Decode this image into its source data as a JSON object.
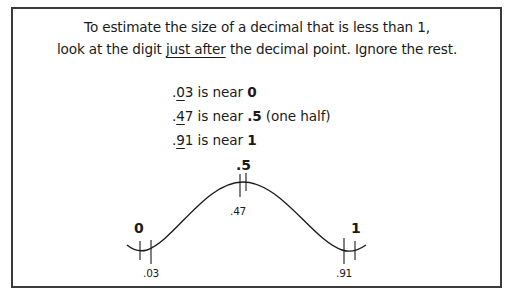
{
  "intro": {
    "line1": "To estimate the size of a decimal that is less than 1,",
    "line2_before": "look at the digit ",
    "line2_underlined": "just after",
    "line2_after": " the decimal point. Ignore the rest."
  },
  "examples": [
    {
      "dot": ".",
      "digit": "0",
      "rest": "3",
      "middle": " is near ",
      "target": "0",
      "note": ""
    },
    {
      "dot": ".",
      "digit": "4",
      "rest": "7",
      "middle": " is near ",
      "target": ".5",
      "note": " (one half)"
    },
    {
      "dot": ".",
      "digit": "9",
      "rest": "1",
      "middle": " is near ",
      "target": "1",
      "note": ""
    }
  ],
  "diagram": {
    "landmarks": [
      {
        "label": "0",
        "value": 0
      },
      {
        "label": ".5",
        "value": 0.5
      },
      {
        "label": "1",
        "value": 1
      }
    ],
    "points": [
      {
        "label": ".03",
        "value": 0.03
      },
      {
        "label": ".47",
        "value": 0.47
      },
      {
        "label": ".91",
        "value": 0.91
      }
    ]
  },
  "colors": {
    "ink": "#1a1a1a",
    "border": "#3a3a3a",
    "background": "#ffffff"
  }
}
